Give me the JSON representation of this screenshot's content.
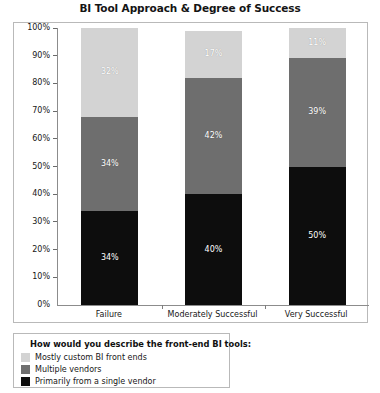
{
  "chart_data": {
    "type": "bar",
    "subtype": "stacked-100-percent",
    "title": "BI Tool Approach & Degree of Success",
    "xlabel": "",
    "ylabel": "",
    "ylim": [
      0,
      100
    ],
    "grid": false,
    "legend_position": "below-left",
    "legend_title": "How would you describe the front-end BI tools:",
    "categories": [
      "Failure",
      "Moderately Successful",
      "Very Successful"
    ],
    "ytick_labels": [
      "100%",
      "90%",
      "80%",
      "70%",
      "60%",
      "50%",
      "40%",
      "30%",
      "20%",
      "10%",
      "0%"
    ],
    "ytick_values": [
      100,
      90,
      80,
      70,
      60,
      50,
      40,
      30,
      20,
      10,
      0
    ],
    "series": [
      {
        "name": "Primarily from a single vendor",
        "color": "#0d0d0d",
        "values": [
          34,
          40,
          50
        ],
        "labels": [
          "34%",
          "40%",
          "50%"
        ]
      },
      {
        "name": "Multiple vendors",
        "color": "#6e6e6e",
        "values": [
          34,
          42,
          39
        ],
        "labels": [
          "34%",
          "42%",
          "39%"
        ]
      },
      {
        "name": "Mostly custom BI front ends",
        "color": "#d3d3d3",
        "values": [
          32,
          17,
          11
        ],
        "labels": [
          "32%",
          "17%",
          "11%"
        ]
      }
    ]
  },
  "legend": {
    "title": "How would you describe the front-end BI tools:",
    "items": [
      {
        "label": "Mostly custom BI front ends",
        "color": "#d3d3d3"
      },
      {
        "label": "Multiple vendors",
        "color": "#6e6e6e"
      },
      {
        "label": "Primarily from a single vendor",
        "color": "#0d0d0d"
      }
    ]
  }
}
